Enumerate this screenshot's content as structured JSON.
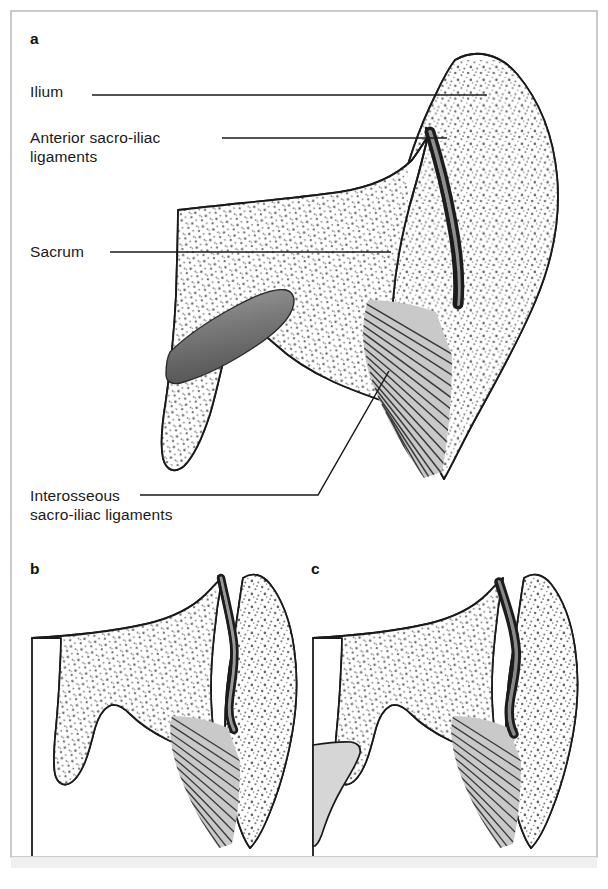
{
  "figure": {
    "kind": "anatomical-line-diagram",
    "background": "#ffffff",
    "border_color": "#b9b9b9",
    "line_color": "#1a1a1a",
    "stipple_color": "#6f6f6f",
    "ligament_fill": "#c9c9c9",
    "ligament_fiber_color": "#3a3a3a",
    "joint_dark": "#1c1c1c",
    "joint_core": "#8f8f8f",
    "canal_gray": "#d6d6d6",
    "canal_gradient_from": "#9a9a9a",
    "canal_gradient_to": "#5d5d5d"
  },
  "panels": [
    {
      "letter": "a",
      "x": 30,
      "y": 30
    },
    {
      "letter": "b",
      "x": 30,
      "y": 560
    },
    {
      "letter": "c",
      "x": 311,
      "y": 560
    }
  ],
  "labels": [
    {
      "id": "ilium",
      "text": "Ilium",
      "x": 30,
      "y": 82,
      "leader": {
        "x1": 92,
        "y1": 95,
        "x2": 487,
        "y2": 95
      }
    },
    {
      "id": "anterior-sacro-iliac-ligaments",
      "line1": "Anterior sacro-iliac",
      "line2": "ligaments",
      "x": 30,
      "y": 128,
      "leader": {
        "x1": 222,
        "y1": 138,
        "x2": 447,
        "y2": 138
      }
    },
    {
      "id": "sacrum",
      "text": "Sacrum",
      "x": 30,
      "y": 242,
      "leader": {
        "x1": 110,
        "y1": 252,
        "x2": 391,
        "y2": 252
      }
    },
    {
      "id": "interosseous-sacro-iliac-ligaments",
      "line1": "Interosseous",
      "line2": "sacro-iliac ligaments",
      "x": 30,
      "y": 486,
      "leader_h": {
        "x1": 140,
        "y1": 495,
        "x2": 318,
        "y2": 495
      },
      "leader_d": {
        "x1": 318,
        "y1": 495,
        "x2": 389,
        "y2": 371
      }
    }
  ]
}
